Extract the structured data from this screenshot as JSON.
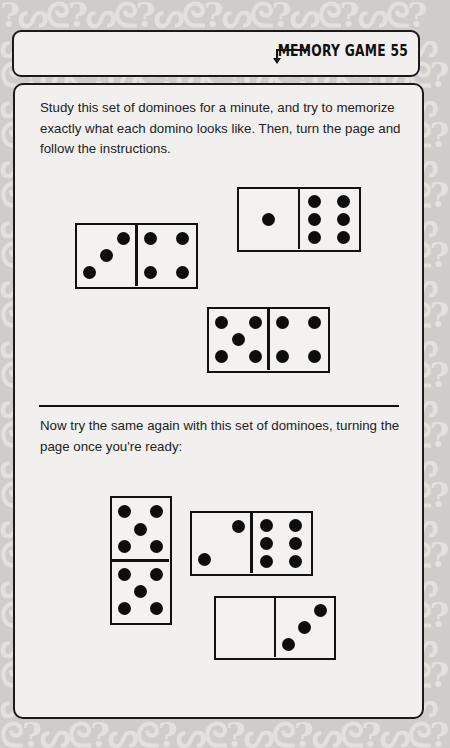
{
  "page": {
    "header": {
      "title": "MEMORY GAME 55",
      "arrow_icon": "arrow-down-left-icon"
    },
    "section1": {
      "instructions": "Study this set of dominoes for a minute, and try to memorize exactly what each domino looks like. Then, turn the page and follow the instructions.",
      "dominoes": [
        {
          "orientation": "horizontal",
          "left": 3,
          "right": 4
        },
        {
          "orientation": "horizontal",
          "left": 1,
          "right": 6
        },
        {
          "orientation": "horizontal",
          "left": 5,
          "right": 4
        }
      ]
    },
    "section2": {
      "instructions": "Now try the same again with this set of dominoes, turning the page once you're ready:",
      "dominoes": [
        {
          "orientation": "vertical",
          "top": 5,
          "bottom": 5
        },
        {
          "orientation": "horizontal",
          "left": 2,
          "right": 6
        },
        {
          "orientation": "horizontal",
          "left": 0,
          "right": 3
        }
      ]
    }
  },
  "colors": {
    "ink": "#111111",
    "panel": "#f1f0ee",
    "background": "#cfcdca"
  }
}
